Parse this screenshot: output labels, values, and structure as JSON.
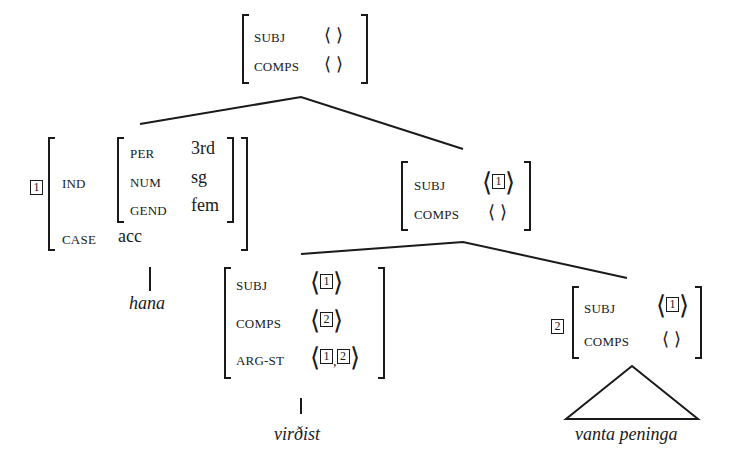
{
  "top_node": {
    "subj_label": "SUBJ",
    "subj_value": "⟨ ⟩",
    "comps_label": "COMPS",
    "comps_value": "⟨ ⟩"
  },
  "left_node": {
    "tag": "1",
    "ind_label": "IND",
    "per_label": "PER",
    "per_value": "3rd",
    "num_label": "NUM",
    "num_value": "sg",
    "gend_label": "GEND",
    "gend_value": "fem",
    "case_label": "CASE",
    "case_value": "acc",
    "word": "hana"
  },
  "mid_node": {
    "subj_label": "SUBJ",
    "subj_tag": "1",
    "comps_label": "COMPS",
    "comps_value": "⟨ ⟩"
  },
  "verb_node": {
    "subj_label": "SUBJ",
    "subj_tag": "1",
    "comps_label": "COMPS",
    "comps_tag": "2",
    "argst_label": "ARG-ST",
    "argst_tag1": "1",
    "argst_sep": ",",
    "argst_tag2": "2",
    "word": "virðist"
  },
  "comp_node": {
    "tag": "2",
    "subj_label": "SUBJ",
    "subj_tag": "1",
    "comps_label": "COMPS",
    "comps_value": "⟨ ⟩",
    "phrase": "vanta peninga"
  }
}
